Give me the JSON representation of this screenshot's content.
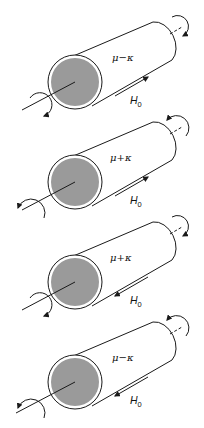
{
  "figure": {
    "colors": {
      "stroke": "#1a1a1a",
      "core_fill": "#9a9a9a",
      "body_fill": "#ffffff"
    },
    "field_label": "H",
    "field_subscript": "0",
    "cylinders": [
      {
        "label": "μ−κ",
        "field_direction": "toward far end",
        "far_rotation": "clockwise",
        "near_rotation": "clockwise"
      },
      {
        "label": "μ+κ",
        "field_direction": "toward far end",
        "far_rotation": "counterclockwise",
        "near_rotation": "counterclockwise"
      },
      {
        "label": "μ+κ",
        "field_direction": "toward near end",
        "far_rotation": "clockwise",
        "near_rotation": "clockwise"
      },
      {
        "label": "μ−κ",
        "field_direction": "toward near end",
        "far_rotation": "counterclockwise",
        "near_rotation": "counterclockwise"
      }
    ]
  }
}
